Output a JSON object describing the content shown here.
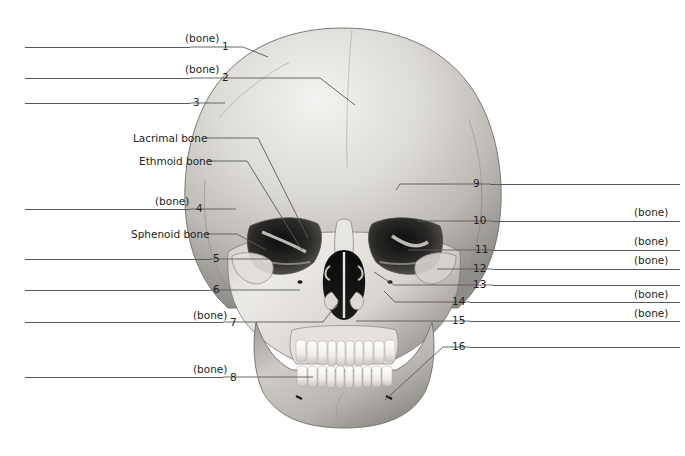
{
  "figure": {
    "background_color": "#ffffff",
    "line_color": "#58595b",
    "text_color": "#231f20"
  },
  "labels_left": [
    {
      "id": "1",
      "number": "1",
      "note": "(bone)",
      "text": "",
      "blank": true,
      "rule_x": 25,
      "rule_w": 165,
      "rule_y": 47,
      "num_x": 222,
      "num_y": 41,
      "note_x": 185,
      "note_y": 33
    },
    {
      "id": "2",
      "number": "2",
      "note": "(bone)",
      "text": "",
      "blank": true,
      "rule_x": 25,
      "rule_w": 165,
      "rule_y": 78,
      "num_x": 222,
      "num_y": 72,
      "note_x": 185,
      "note_y": 64
    },
    {
      "id": "3",
      "number": "3",
      "note": "",
      "text": "",
      "blank": true,
      "rule_x": 25,
      "rule_w": 165,
      "rule_y": 103,
      "num_x": 193,
      "num_y": 97,
      "note_x": 0,
      "note_y": 0
    },
    {
      "id": "L1",
      "number": "",
      "note": "",
      "text": "Lacrimal bone",
      "blank": false,
      "rule_x": 0,
      "rule_w": 0,
      "rule_y": 0,
      "num_x": 0,
      "num_y": 0,
      "note_x": 133,
      "note_y": 133
    },
    {
      "id": "L2",
      "number": "",
      "note": "",
      "text": "Ethmoid bone",
      "blank": false,
      "rule_x": 0,
      "rule_w": 0,
      "rule_y": 0,
      "num_x": 0,
      "num_y": 0,
      "note_x": 139,
      "note_y": 156
    },
    {
      "id": "4",
      "number": "4",
      "note": "(bone)",
      "text": "",
      "blank": true,
      "rule_x": 25,
      "rule_w": 165,
      "rule_y": 209,
      "num_x": 196,
      "num_y": 203,
      "note_x": 155,
      "note_y": 196
    },
    {
      "id": "L3",
      "number": "",
      "note": "",
      "text": "Sphenoid bone",
      "blank": false,
      "rule_x": 0,
      "rule_w": 0,
      "rule_y": 0,
      "num_x": 0,
      "num_y": 0,
      "note_x": 131,
      "note_y": 229
    },
    {
      "id": "5",
      "number": "5",
      "note": "",
      "text": "",
      "blank": true,
      "rule_x": 25,
      "rule_w": 185,
      "rule_y": 259,
      "num_x": 213,
      "num_y": 253,
      "note_x": 0,
      "note_y": 0
    },
    {
      "id": "6",
      "number": "6",
      "note": "",
      "text": "",
      "blank": true,
      "rule_x": 25,
      "rule_w": 185,
      "rule_y": 290,
      "num_x": 213,
      "num_y": 284,
      "note_x": 0,
      "note_y": 0
    },
    {
      "id": "7",
      "number": "7",
      "note": "(bone)",
      "text": "",
      "blank": true,
      "rule_x": 25,
      "rule_w": 198,
      "rule_y": 322,
      "num_x": 230,
      "num_y": 317,
      "note_x": 193,
      "note_y": 310
    },
    {
      "id": "8",
      "number": "8",
      "note": "(bone)",
      "text": "",
      "blank": true,
      "rule_x": 25,
      "rule_w": 198,
      "rule_y": 377,
      "num_x": 230,
      "num_y": 372,
      "note_x": 193,
      "note_y": 364
    }
  ],
  "labels_right": [
    {
      "id": "9",
      "number": "9",
      "note": "",
      "rule_x": 490,
      "rule_w": 190,
      "rule_y": 184,
      "num_x": 473,
      "num_y": 178,
      "note_x": 634,
      "note_y": 0
    },
    {
      "id": "10",
      "number": "10",
      "note": "(bone)",
      "rule_x": 493,
      "rule_w": 187,
      "rule_y": 221,
      "num_x": 473,
      "num_y": 215,
      "note_x": 634,
      "note_y": 207
    },
    {
      "id": "11",
      "number": "11",
      "note": "(bone)",
      "rule_x": 493,
      "rule_w": 187,
      "rule_y": 250,
      "num_x": 475,
      "num_y": 244,
      "note_x": 634,
      "note_y": 236
    },
    {
      "id": "12",
      "number": "12",
      "note": "(bone)",
      "rule_x": 493,
      "rule_w": 187,
      "rule_y": 269,
      "num_x": 473,
      "num_y": 263,
      "note_x": 634,
      "note_y": 255
    },
    {
      "id": "13",
      "number": "13",
      "note": "",
      "rule_x": 493,
      "rule_w": 187,
      "rule_y": 285,
      "num_x": 473,
      "num_y": 279,
      "note_x": 0,
      "note_y": 0
    },
    {
      "id": "14",
      "number": "14",
      "note": "(bone)",
      "rule_x": 470,
      "rule_w": 210,
      "rule_y": 302,
      "num_x": 452,
      "num_y": 296,
      "note_x": 634,
      "note_y": 289
    },
    {
      "id": "15",
      "number": "15",
      "note": "(bone)",
      "rule_x": 470,
      "rule_w": 210,
      "rule_y": 321,
      "num_x": 452,
      "num_y": 315,
      "note_x": 634,
      "note_y": 308
    },
    {
      "id": "16",
      "number": "16",
      "note": "",
      "rule_x": 470,
      "rule_w": 210,
      "rule_y": 347,
      "num_x": 452,
      "num_y": 341,
      "note_x": 0,
      "note_y": 0
    }
  ],
  "leaders": [
    {
      "name": "leader-1",
      "points": "190,47 243,47 268,57"
    },
    {
      "name": "leader-2",
      "points": "190,78 320,78 355,105"
    },
    {
      "name": "leader-3",
      "points": "190,103 225,103"
    },
    {
      "name": "leader-lacrimal",
      "points": "205,138 258,138 308,238"
    },
    {
      "name": "leader-ethmoid",
      "points": "208,161 247,161 302,250"
    },
    {
      "name": "leader-4",
      "points": "190,209 236,209"
    },
    {
      "name": "leader-sphenoid",
      "points": "206,234 237,234 266,250"
    },
    {
      "name": "leader-5",
      "points": "210,259 268,259"
    },
    {
      "name": "leader-6",
      "points": "210,290 300,290"
    },
    {
      "name": "leader-7",
      "points": "223,322 323,322 337,304"
    },
    {
      "name": "leader-8",
      "points": "223,377 313,377"
    },
    {
      "name": "leader-9",
      "points": "490,184 400,184 396,190"
    },
    {
      "name": "leader-10",
      "points": "493,221 418,221"
    },
    {
      "name": "leader-11",
      "points": "493,250 408,250"
    },
    {
      "name": "leader-12",
      "points": "493,269 437,269"
    },
    {
      "name": "leader-13",
      "points": "493,285 394,285 374,272"
    },
    {
      "name": "leader-14",
      "points": "470,302 395,302 384,291"
    },
    {
      "name": "leader-15",
      "points": "470,321 356,321"
    },
    {
      "name": "leader-16",
      "points": "470,347 443,347 385,400"
    }
  ]
}
